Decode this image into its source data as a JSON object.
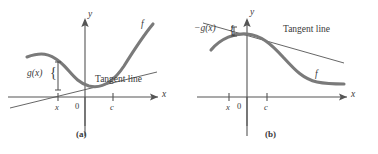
{
  "figure": {
    "panels": [
      {
        "id": "a",
        "caption": "(a)",
        "axes": {
          "x_label": "x",
          "y_label": "y"
        },
        "ticks": [
          {
            "name": "x-tick",
            "label": "x"
          },
          {
            "name": "origin-tick",
            "label": "0"
          },
          {
            "name": "c-tick",
            "label": "c"
          }
        ],
        "curve_label": "f",
        "tangent_label": "Tangent line",
        "gap_label": "g(x)",
        "brace": "{",
        "description": "Concave curve f above its tangent line at c; g(x) is the vertical gap at x"
      },
      {
        "id": "b",
        "caption": "(b)",
        "axes": {
          "x_label": "x",
          "y_label": "y"
        },
        "ticks": [
          {
            "name": "x-tick",
            "label": "x"
          },
          {
            "name": "origin-tick",
            "label": "0"
          },
          {
            "name": "c-tick",
            "label": "c"
          }
        ],
        "curve_label": "f",
        "tangent_label": "Tangent line",
        "gap_label": "−g(x)",
        "brace": "{",
        "description": "Curve f below its tangent line at c; −g(x) is the vertical gap at x"
      }
    ],
    "colors": {
      "curve": "#7a7a7a",
      "axis": "#555555",
      "tangent": "#555555",
      "text": "#3a3a3a",
      "background": "#ffffff"
    }
  }
}
